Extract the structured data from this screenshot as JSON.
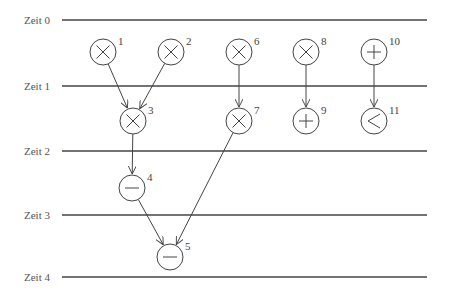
{
  "diagram": {
    "type": "scheduling-dataflow-graph",
    "time_steps": [
      {
        "label": "Zeit 0",
        "y": 20
      },
      {
        "label": "Zeit 1",
        "y": 86
      },
      {
        "label": "Zeit 2",
        "y": 151
      },
      {
        "label": "Zeit 3",
        "y": 215
      },
      {
        "label": "Zeit 4",
        "y": 277
      }
    ],
    "nodes": [
      {
        "id": "1",
        "op": "multiply",
        "x": 103,
        "y": 52
      },
      {
        "id": "2",
        "op": "multiply",
        "x": 171,
        "y": 52
      },
      {
        "id": "3",
        "op": "multiply",
        "x": 133,
        "y": 121
      },
      {
        "id": "4",
        "op": "subtract",
        "x": 132,
        "y": 188
      },
      {
        "id": "5",
        "op": "subtract",
        "x": 170,
        "y": 257
      },
      {
        "id": "6",
        "op": "multiply",
        "x": 239,
        "y": 52
      },
      {
        "id": "7",
        "op": "multiply",
        "x": 239,
        "y": 121
      },
      {
        "id": "8",
        "op": "multiply",
        "x": 306,
        "y": 52
      },
      {
        "id": "9",
        "op": "add",
        "x": 306,
        "y": 121
      },
      {
        "id": "10",
        "op": "add",
        "x": 374,
        "y": 52
      },
      {
        "id": "11",
        "op": "less-than",
        "x": 374,
        "y": 121
      }
    ],
    "edges": [
      {
        "from": "1",
        "to": "3"
      },
      {
        "from": "2",
        "to": "3"
      },
      {
        "from": "3",
        "to": "4"
      },
      {
        "from": "4",
        "to": "5"
      },
      {
        "from": "7",
        "to": "5"
      },
      {
        "from": "6",
        "to": "7"
      },
      {
        "from": "8",
        "to": "9"
      },
      {
        "from": "10",
        "to": "11"
      }
    ],
    "colors": {
      "stroke": "#444444",
      "text": "#555555",
      "background": "#ffffff"
    }
  }
}
